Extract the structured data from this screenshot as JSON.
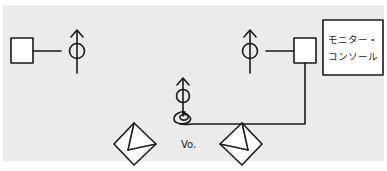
{
  "diagram": {
    "monitor_console": {
      "line1": "モニター・",
      "line2": "コンソール"
    },
    "vo_label": "Vo.",
    "colors": {
      "panel_bg": "#ebebeb",
      "stroke": "#1a1a1a",
      "box_fill": "#ffffff"
    }
  }
}
